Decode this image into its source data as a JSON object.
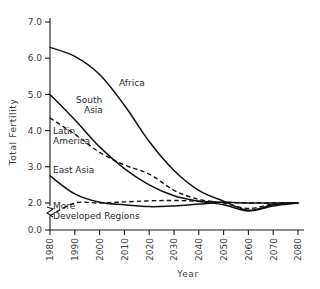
{
  "chart_data": {
    "type": "line",
    "title": "",
    "xlabel": "Year",
    "ylabel": "Total Fertility",
    "xlim": [
      1980,
      2080
    ],
    "ylim": [
      1.4,
      7.0
    ],
    "y_axis_break": true,
    "grid": false,
    "legend": "inline-labels",
    "x_ticks": [
      "1980",
      "1990",
      "2000",
      "2010",
      "2020",
      "2030",
      "2040",
      "2050",
      "2060",
      "2070",
      "2080"
    ],
    "y_ticks": [
      "0.0",
      "2.0",
      "3.0",
      "4.0",
      "5.0",
      "6.0",
      "7.0"
    ],
    "x": [
      1980,
      1990,
      2000,
      2010,
      2020,
      2030,
      2040,
      2050,
      2060,
      2070,
      2080
    ],
    "series": [
      {
        "name": "Africa",
        "style": "solid",
        "label": "Africa",
        "values": [
          6.3,
          6.05,
          5.55,
          4.7,
          3.7,
          2.9,
          2.35,
          2.05,
          1.8,
          1.95,
          2.0
        ]
      },
      {
        "name": "South Asia",
        "style": "solid",
        "label": "South Asia",
        "values": [
          5.0,
          4.3,
          3.55,
          2.95,
          2.5,
          2.2,
          2.05,
          1.95,
          1.78,
          1.92,
          2.0
        ]
      },
      {
        "name": "Latin America",
        "style": "dashed",
        "label": "Latin America",
        "values": [
          4.35,
          3.9,
          3.4,
          3.05,
          2.8,
          2.35,
          2.1,
          2.0,
          1.85,
          1.97,
          2.0
        ]
      },
      {
        "name": "East Asia",
        "style": "solid",
        "label": "East Asia",
        "values": [
          2.75,
          2.25,
          2.02,
          1.95,
          1.9,
          1.92,
          1.97,
          2.02,
          2.0,
          2.0,
          2.0
        ]
      },
      {
        "name": "More Developed Regions",
        "style": "dashed",
        "label": "More Developed Regions",
        "values": [
          1.65,
          2.0,
          2.0,
          2.03,
          2.06,
          2.07,
          2.05,
          2.02,
          2.0,
          2.0,
          2.0
        ]
      }
    ]
  }
}
